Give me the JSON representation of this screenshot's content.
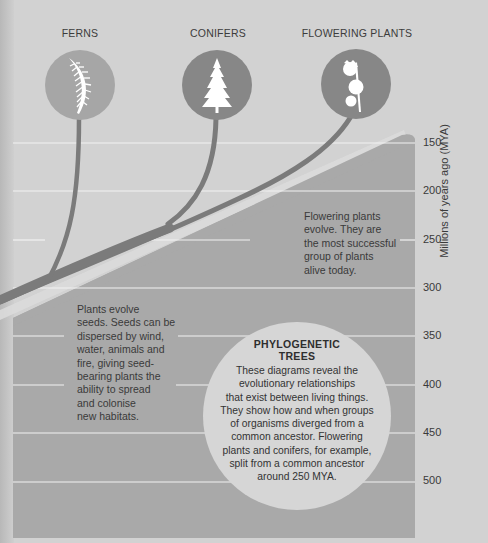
{
  "groups": [
    {
      "label": "FERNS",
      "icon": "fern-icon"
    },
    {
      "label": "CONIFERS",
      "icon": "conifer-tree-icon"
    },
    {
      "label": "FLOWERING PLANTS",
      "icon": "flower-icon"
    }
  ],
  "axis": {
    "title": "Millions of years ago (MYA)",
    "ticks": [
      "150",
      "200",
      "250",
      "300",
      "350",
      "400",
      "450",
      "500"
    ]
  },
  "notes": {
    "seeds": [
      "Plants evolve",
      "seeds. Seeds can be",
      "dispersed by wind,",
      "water, animals and",
      "fire, giving seed-",
      "bearing plants the",
      "ability to spread",
      "and colonise",
      "new habitats."
    ],
    "flowering": [
      "Flowering plants",
      "evolve. They are",
      "the most successful",
      "group of plants",
      "alive today."
    ]
  },
  "info": {
    "title_lines": [
      "PHYLOGENETIC",
      "TREES"
    ],
    "body_lines": [
      "These diagrams reveal the",
      "evolutionary relationships",
      "that exist between living things.",
      "They show how and when groups",
      "of organisms diverged from a",
      "common ancestor. Flowering",
      "plants and conifers, for example,",
      "split from a common ancestor",
      "around 250 MYA."
    ]
  },
  "colors": {
    "background": "#d2d2d2",
    "shaded_region": "#a8a8a8",
    "branch": "#7d7d7d",
    "fern_circle": "#a6a6a6",
    "conifer_circle": "#878787",
    "flower_circle": "#878787",
    "info_circle": "#d6d6d6",
    "gridline": "#f2f2f2"
  }
}
